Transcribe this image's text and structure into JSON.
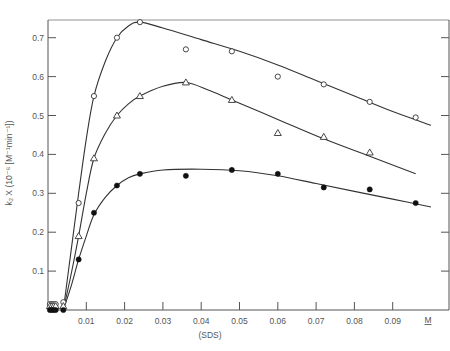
{
  "chart_data": {
    "type": "scatter",
    "title": "",
    "xlabel": "(SDS)",
    "xunit_label": "M",
    "ylabel": "k2 X (10^-6 [M^-1 min^-1])",
    "ylabel_display": "k₂ X (10⁻⁶ [M⁻¹min⁻¹])",
    "xlim": [
      0,
      0.1
    ],
    "ylim": [
      0,
      0.75
    ],
    "x_ticks": [
      "0.01",
      "0.02",
      "0.03",
      "0.04",
      "0.05",
      "0.06",
      "0.07",
      "0.08",
      "0.09"
    ],
    "y_ticks": [
      "0.1",
      "0.2",
      "0.3",
      "0.4",
      "0.5",
      "0.6",
      "0.7"
    ],
    "grid": false,
    "legend": "none",
    "series": [
      {
        "name": "open-circles",
        "marker": "circle-open",
        "x": [
          0.0005,
          0.001,
          0.0015,
          0.002,
          0.004,
          0.008,
          0.012,
          0.018,
          0.024,
          0.036,
          0.048,
          0.06,
          0.072,
          0.084,
          0.096
        ],
        "y": [
          0.015,
          0.015,
          0.015,
          0.015,
          0.02,
          0.275,
          0.55,
          0.7,
          0.74,
          0.67,
          0.665,
          0.6,
          0.58,
          0.535,
          0.495
        ]
      },
      {
        "name": "open-triangles",
        "marker": "triangle-open",
        "x": [
          0.0005,
          0.001,
          0.0015,
          0.002,
          0.004,
          0.008,
          0.012,
          0.018,
          0.024,
          0.036,
          0.048,
          0.06,
          0.072,
          0.084
        ],
        "y": [
          0.01,
          0.01,
          0.01,
          0.01,
          0.01,
          0.19,
          0.39,
          0.5,
          0.55,
          0.585,
          0.54,
          0.455,
          0.445,
          0.405
        ]
      },
      {
        "name": "filled-circles",
        "marker": "circle-filled",
        "x": [
          0.0005,
          0.001,
          0.0015,
          0.002,
          0.004,
          0.008,
          0.012,
          0.018,
          0.024,
          0.036,
          0.048,
          0.06,
          0.072,
          0.084,
          0.096
        ],
        "y": [
          0.0,
          0.0,
          0.0,
          0.0,
          0.0,
          0.13,
          0.25,
          0.32,
          0.35,
          0.345,
          0.36,
          0.35,
          0.315,
          0.31,
          0.275
        ]
      }
    ],
    "fit_curves": [
      {
        "name": "open-circles-fit",
        "points": [
          [
            0.004,
            0
          ],
          [
            0.006,
            0.15
          ],
          [
            0.008,
            0.3
          ],
          [
            0.01,
            0.44
          ],
          [
            0.012,
            0.55
          ],
          [
            0.015,
            0.64
          ],
          [
            0.018,
            0.7
          ],
          [
            0.021,
            0.73
          ],
          [
            0.024,
            0.74
          ],
          [
            0.03,
            0.725
          ],
          [
            0.04,
            0.695
          ],
          [
            0.05,
            0.665
          ],
          [
            0.06,
            0.63
          ],
          [
            0.07,
            0.59
          ],
          [
            0.08,
            0.55
          ],
          [
            0.09,
            0.51
          ],
          [
            0.1,
            0.475
          ]
        ]
      },
      {
        "name": "open-triangles-fit",
        "points": [
          [
            0.004,
            0
          ],
          [
            0.006,
            0.09
          ],
          [
            0.008,
            0.19
          ],
          [
            0.01,
            0.3
          ],
          [
            0.012,
            0.39
          ],
          [
            0.015,
            0.455
          ],
          [
            0.018,
            0.5
          ],
          [
            0.021,
            0.53
          ],
          [
            0.024,
            0.55
          ],
          [
            0.03,
            0.575
          ],
          [
            0.036,
            0.585
          ],
          [
            0.042,
            0.565
          ],
          [
            0.048,
            0.54
          ],
          [
            0.06,
            0.49
          ],
          [
            0.072,
            0.44
          ],
          [
            0.084,
            0.395
          ],
          [
            0.096,
            0.35
          ]
        ]
      },
      {
        "name": "filled-circles-fit",
        "points": [
          [
            0.004,
            0
          ],
          [
            0.006,
            0.06
          ],
          [
            0.008,
            0.13
          ],
          [
            0.01,
            0.19
          ],
          [
            0.012,
            0.245
          ],
          [
            0.015,
            0.29
          ],
          [
            0.018,
            0.32
          ],
          [
            0.021,
            0.34
          ],
          [
            0.024,
            0.35
          ],
          [
            0.03,
            0.36
          ],
          [
            0.04,
            0.362
          ],
          [
            0.05,
            0.358
          ],
          [
            0.06,
            0.345
          ],
          [
            0.07,
            0.325
          ],
          [
            0.08,
            0.305
          ],
          [
            0.09,
            0.285
          ],
          [
            0.1,
            0.265
          ]
        ]
      }
    ]
  },
  "axes": {
    "x_label": "(SDS)",
    "x_unit": "M",
    "y_label": "k₂ X (10⁻⁶ [M⁻¹min⁻¹])"
  }
}
